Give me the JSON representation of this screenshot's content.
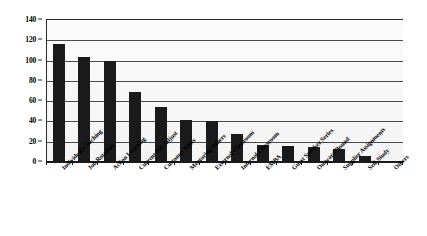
{
  "chart_data": {
    "type": "bar",
    "title": "",
    "subtitle": "",
    "xlabel": "",
    "ylabel": "",
    "ylim": [
      0,
      140
    ],
    "ytick_step": 20,
    "yticks": [
      0,
      20,
      40,
      60,
      80,
      100,
      120,
      140
    ],
    "ytick_labels": [
      "0",
      "20",
      "40",
      "60",
      "80",
      "100",
      "120",
      "140"
    ],
    "grid": true,
    "legend": false,
    "legend_position": "none",
    "orientation": "vertical",
    "bar_color": "#1a1a1a",
    "plot_background": "#f7f7f7",
    "categories": [
      "Individual Coaching",
      "Job Rotation",
      "Action Learning",
      "Current Job Adjust",
      "Customer Visits",
      "Mentoring Others",
      "External Classroom",
      "Internal Classroom",
      "EMBA",
      "Guest Speaker Series",
      "Outward Bound",
      "Supplier Assignments",
      "Self-Study",
      "Others"
    ],
    "values": [
      115,
      103,
      99,
      68,
      53,
      40,
      39,
      27,
      16,
      15,
      14,
      12,
      5,
      0
    ]
  },
  "axes": {
    "y_axis_name": "value-axis",
    "x_axis_name": "category-axis"
  }
}
